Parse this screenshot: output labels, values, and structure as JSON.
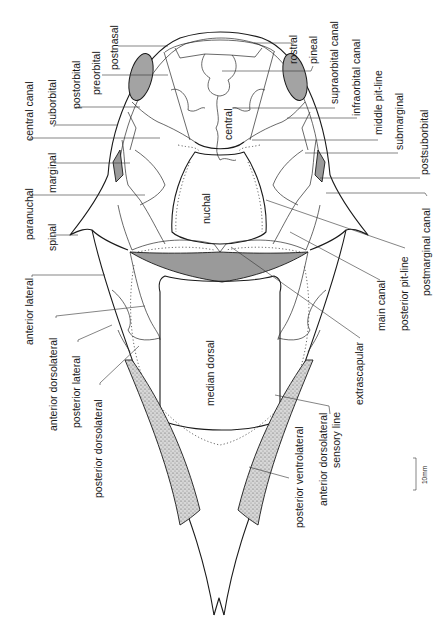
{
  "figure": {
    "orientation": "labels rotated 90 degrees counter-clockwise",
    "colors": {
      "line": "#1a1a1a",
      "shaded_plate": "#9a9a9a",
      "orbit": "#a3a3a3",
      "background": "#ffffff"
    }
  },
  "labels": {
    "postnasal": "postnasal",
    "preorbital": "preorbital",
    "postorbital": "postorbital",
    "suborbital": "suborbital",
    "central_canal": "central canal",
    "marginal": "marginal",
    "paranuchal": "paranuchal",
    "spinal": "spinal",
    "anterior_lateral": "anterior  lateral",
    "anterior_dorsolateral": "anterior  dorsolateral",
    "posterior_lateral": "posterior  lateral",
    "posterior_dorsolateral": "posterior dorsolateral",
    "rostral": "rostral",
    "pineal": "pineal",
    "supraorbital_canal": "supraorbital canal",
    "infraorbital_canal": "infraorbital canal",
    "middle_pit_line": "middle pit-line",
    "submarginal": "submarginal",
    "postsuborbital": "postsuborbital",
    "postmarginal_canal": "postmarginal canal",
    "posterior_pit_line": "posterior  pit-line",
    "main_canal": "main canal",
    "extrascapular": "extrascapular",
    "anterior_dorsolateral_sensory_line_1": "anterior  dorsolateral",
    "anterior_dorsolateral_sensory_line_2": "sensory  line",
    "posterior_ventrolateral": "posterior  ventrolateral",
    "central": "central",
    "nuchal": "nuchal",
    "median_dorsal": "median dorsal"
  },
  "scale_bar": {
    "label": "10mm"
  }
}
